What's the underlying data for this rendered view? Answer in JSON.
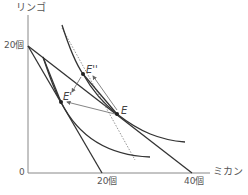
{
  "labels": {
    "y_axis": "リンゴ",
    "x_axis": "ミカン",
    "y_tick": "20個",
    "x_tick_1": "20個",
    "x_tick_2": "40個",
    "origin": "0"
  },
  "points": {
    "E": "E",
    "E_prime": "E'",
    "E_double_prime": "E''"
  },
  "colors": {
    "axis": "#888888",
    "line": "#333333",
    "arrow": "#666666",
    "dotted": "#888888",
    "text": "#555555"
  },
  "geometry": {
    "origin": [
      28,
      173
    ],
    "y_axis_top": [
      28,
      15
    ],
    "x_axis_end": [
      210,
      173
    ],
    "y20": [
      28,
      46
    ],
    "x20": [
      102,
      173
    ],
    "x40": [
      192,
      173
    ],
    "E": [
      117,
      114
    ],
    "E_prime": [
      61,
      102
    ],
    "E_double_prime": [
      83,
      74
    ]
  }
}
